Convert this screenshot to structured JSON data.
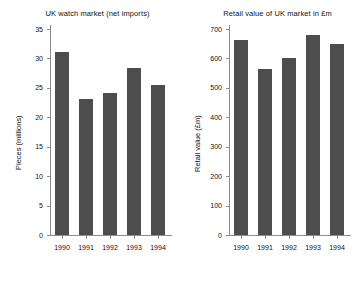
{
  "figure": {
    "background": "#ffffff",
    "bar_color": "#4d4d4d",
    "axis_color": "#8c8c8c"
  },
  "chart_data": [
    {
      "type": "bar",
      "id": "uk-watch-market",
      "title": "UK watch market (net imports)",
      "xlabel": "",
      "ylabel": "Pieces (millions)",
      "categories": [
        "1990",
        "1991",
        "1992",
        "1993",
        "1994"
      ],
      "values": [
        31.1,
        23.1,
        24.2,
        28.3,
        25.5
      ],
      "ylim": [
        0,
        35
      ],
      "yticks": [
        0,
        5,
        10,
        15,
        20,
        25,
        30,
        35
      ],
      "ytick_labels": [
        "0",
        "5",
        "10",
        "15",
        "20",
        "25",
        "30",
        "35"
      ],
      "grid": false,
      "legend": false
    },
    {
      "type": "bar",
      "id": "uk-retail-value",
      "title": "Retail value of UK market in £m",
      "xlabel": "",
      "ylabel": "Retail value (£m)",
      "categories": [
        "1990",
        "1991",
        "1992",
        "1993",
        "1994"
      ],
      "values": [
        662,
        565,
        601,
        679,
        648
      ],
      "ylim": [
        0,
        700
      ],
      "yticks": [
        0,
        100,
        200,
        300,
        400,
        500,
        600,
        700
      ],
      "ytick_labels": [
        "0",
        "100",
        "200",
        "300",
        "400",
        "500",
        "600",
        "700"
      ],
      "grid": false,
      "legend": false
    }
  ]
}
